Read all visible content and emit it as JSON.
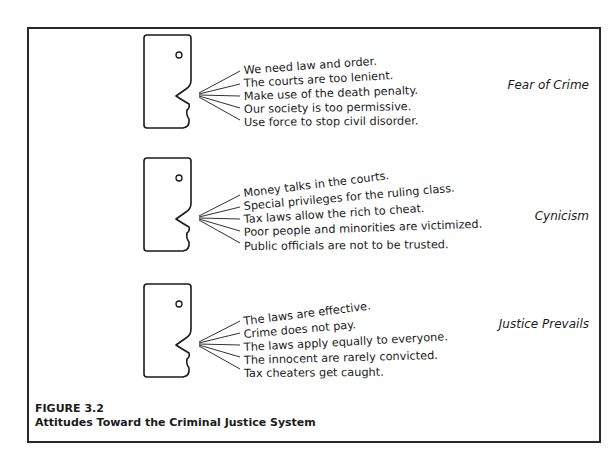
{
  "figure": {
    "number": "FIGURE 3.2",
    "title": "Attitudes Toward the Criminal Justice System"
  },
  "groups": [
    {
      "category": "Fear of Crime",
      "statements": [
        "We need law and order.",
        "The courts are too lenient.",
        "Make use of the death penalty.",
        "Our society is too permissive.",
        "Use force to stop civil disorder."
      ]
    },
    {
      "category": "Cynicism",
      "statements": [
        "Money talks in the courts.",
        "Special privileges for the ruling class.",
        "Tax laws allow the rich to cheat.",
        "Poor people and minorities are victimized.",
        "Public officials are not to be trusted."
      ]
    },
    {
      "category": "Justice Prevails",
      "statements": [
        "The laws are effective.",
        "Crime does not pay.",
        "The laws apply equally to everyone.",
        "The innocent are rarely convicted.",
        "Tax cheaters get caught."
      ]
    }
  ],
  "colors": {
    "ink": "#1a1a1a",
    "background": "#ffffff"
  }
}
